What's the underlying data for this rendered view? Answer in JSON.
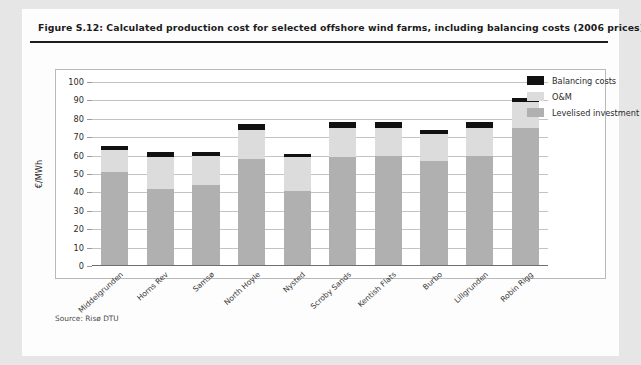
{
  "figure": {
    "title": "Figure S.12: Calculated production cost for selected offshore wind farms, including balancing costs (2006 prices)",
    "source": "Source: Risø DTU"
  },
  "colors": {
    "balancing": "#111111",
    "om": "#dcdcdc",
    "investment": "#b0b0b0",
    "page_background": "#e6e6e6",
    "panel_background": "#fdfdfd",
    "grid": "#c3c3c3",
    "rule": "#1d1d1d"
  },
  "legend": {
    "position": "top-right",
    "items": [
      {
        "label": "Balancing costs",
        "color": "#111111"
      },
      {
        "label": "O&M",
        "color": "#dcdcdc"
      },
      {
        "label": "Levelised investment",
        "color": "#b0b0b0"
      }
    ]
  },
  "chart_data": {
    "type": "bar",
    "title": "Calculated production cost for selected offshore wind farms, including balancing costs (2006 prices)",
    "xlabel": "",
    "ylabel": "€/MWh",
    "ylim": [
      0,
      100
    ],
    "yticks": [
      0,
      10,
      20,
      30,
      40,
      50,
      60,
      70,
      80,
      90,
      100
    ],
    "ytick_labels": [
      "0",
      "10",
      "20",
      "30",
      "40",
      "50",
      "60",
      "70",
      "80",
      "90",
      "100"
    ],
    "grid": true,
    "stacked": true,
    "categories": [
      "Middelgrunden",
      "Horns Rev",
      "Samsø",
      "North Hoyle",
      "Nysted",
      "Scroby Sands",
      "Kentish Flats",
      "Burbo",
      "Lillgrunden",
      "Robin Rigg"
    ],
    "series": [
      {
        "name": "Levelised investment",
        "color": "#b0b0b0",
        "values": [
          51,
          42,
          44,
          58,
          41,
          59,
          60,
          57,
          60,
          75
        ]
      },
      {
        "name": "O&M",
        "color": "#dcdcdc",
        "values": [
          12,
          17,
          16,
          16,
          18,
          16,
          15,
          15,
          15,
          14
        ]
      },
      {
        "name": "Balancing costs",
        "color": "#111111",
        "values": [
          2,
          3,
          2,
          3,
          2,
          3,
          3,
          2,
          3,
          2.5
        ]
      }
    ],
    "totals": [
      65,
      62,
      62,
      77,
      61,
      78,
      78,
      74,
      78,
      91.5
    ]
  }
}
